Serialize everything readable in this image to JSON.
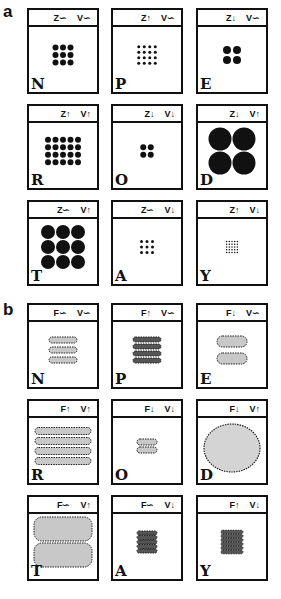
{
  "panels": [
    {
      "label": "a",
      "cells": [
        {
          "letter": "N",
          "h1": "Z∽",
          "h2": "V∽",
          "grid": 3,
          "dot": 6,
          "gap": 1.5
        },
        {
          "letter": "P",
          "h1": "Z↑",
          "h2": "V∽",
          "grid": 4,
          "dot": 3,
          "gap": 2.5
        },
        {
          "letter": "E",
          "h1": "Z↓",
          "h2": "V∽",
          "grid": 2,
          "dot": 8,
          "gap": 2
        },
        {
          "letter": "R",
          "h1": "Z↑",
          "h2": "V↑",
          "grid": 5,
          "gridRows": 4,
          "dot": 6,
          "gap": 1.5
        },
        {
          "letter": "O",
          "h1": "Z↓",
          "h2": "V↓",
          "grid": 2,
          "dot": 6,
          "gap": 1.5
        },
        {
          "letter": "D",
          "h1": "Z↓",
          "h2": "V↑",
          "grid": 2,
          "dot": 23,
          "gap": 1
        },
        {
          "letter": "T",
          "h1": "Z∽",
          "h2": "V↑",
          "grid": 3,
          "dot": 14,
          "gap": 1
        },
        {
          "letter": "A",
          "h1": "Z∽",
          "h2": "V↓",
          "grid": 3,
          "dot": 3,
          "gap": 2.5
        },
        {
          "letter": "Y",
          "h1": "Z↑",
          "h2": "V↓",
          "grid": 5,
          "dot": 1.5,
          "gap": 1.2
        }
      ]
    },
    {
      "label": "b",
      "cells": [
        {
          "letter": "N",
          "h1": "F∽",
          "h2": "V∽",
          "bars": 3,
          "bw": 28,
          "bh": 6,
          "bg": 4
        },
        {
          "letter": "P",
          "h1": "F↑",
          "h2": "V∽",
          "bars": 4,
          "bw": 28,
          "bh": 5,
          "bg": 2
        },
        {
          "letter": "E",
          "h1": "F↓",
          "h2": "V∽",
          "bars": 2,
          "bw": 30,
          "bh": 11,
          "bg": 6
        },
        {
          "letter": "R",
          "h1": "F↑",
          "h2": "V↑",
          "bars": 4,
          "bw": 56,
          "bh": 7,
          "bg": 3
        },
        {
          "letter": "O",
          "h1": "F↓",
          "h2": "V↓",
          "bars": 2,
          "bw": 20,
          "bh": 6,
          "bg": 2
        },
        {
          "letter": "D",
          "h1": "F↓",
          "h2": "V↑",
          "blob": true
        },
        {
          "letter": "T",
          "h1": "F∽",
          "h2": "V↑",
          "bars": 2,
          "bw": 58,
          "bh": 24,
          "bg": 2
        },
        {
          "letter": "A",
          "h1": "F∽",
          "h2": "V↓",
          "bars": 5,
          "bw": 20,
          "bh": 4,
          "bg": 0.5
        },
        {
          "letter": "Y",
          "h1": "F↑",
          "h2": "V↓",
          "bars": 6,
          "bw": 22,
          "bh": 3.5,
          "bg": 0.5
        }
      ]
    }
  ]
}
